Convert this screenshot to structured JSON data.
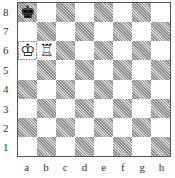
{
  "board": {
    "ranks": [
      "8",
      "7",
      "6",
      "5",
      "4",
      "3",
      "2",
      "1"
    ],
    "files": [
      "a",
      "b",
      "c",
      "d",
      "e",
      "f",
      "g",
      "h"
    ],
    "colors": {
      "light": "#ffffff",
      "dark": "#a8a8a8",
      "border": "#555555"
    },
    "pieces": [
      {
        "square": "a8",
        "piece": "king",
        "color": "black",
        "glyph": "♚"
      },
      {
        "square": "a6",
        "piece": "king",
        "color": "white",
        "glyph": "♔"
      },
      {
        "square": "b6",
        "piece": "rook",
        "color": "white",
        "glyph": "♖"
      }
    ]
  }
}
